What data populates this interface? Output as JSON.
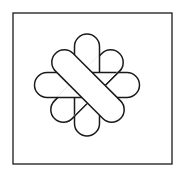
{
  "figure": {
    "stroke_color": "#1a1a1a",
    "fill_color": "#ffffff",
    "frame": {
      "x": 13,
      "y": 13,
      "width": 159,
      "height": 151
    },
    "shapes": [
      {
        "name": "diagonal-capsule-back",
        "cx": 87,
        "cy": 86,
        "length": 92,
        "thickness": 25,
        "angle": -45
      },
      {
        "name": "vertical-capsule",
        "cx": 87,
        "cy": 85,
        "length": 102,
        "thickness": 25,
        "angle": 90
      },
      {
        "name": "horizontal-capsule",
        "cx": 87,
        "cy": 85,
        "length": 105,
        "thickness": 25,
        "angle": 0
      },
      {
        "name": "diagonal-capsule-front",
        "cx": 88,
        "cy": 86,
        "length": 92,
        "thickness": 25,
        "angle": 45
      }
    ]
  }
}
